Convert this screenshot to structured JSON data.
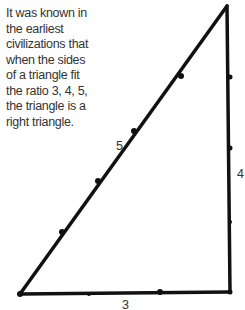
{
  "caption": {
    "lines": [
      "It was known in",
      "the earliest",
      "civilizations that",
      "when the sides",
      "of a triangle fit",
      "the ratio 3, 4, 5,",
      "the triangle is a",
      "right triangle."
    ]
  },
  "triangle": {
    "hypotenuse_label": "5",
    "vertical_label": "4",
    "base_label": "3",
    "stroke_color": "#111111"
  }
}
